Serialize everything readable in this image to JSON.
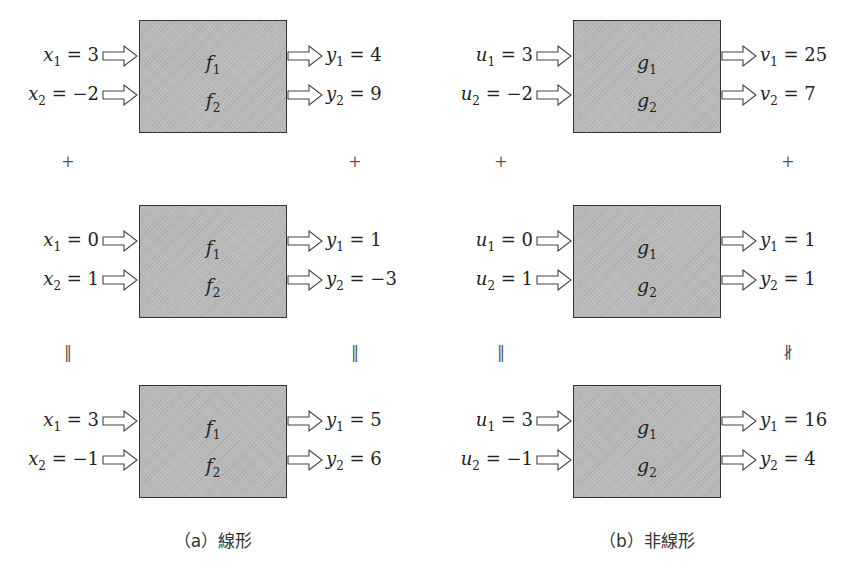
{
  "panels": [
    {
      "id": "a",
      "caption": "（a）線形",
      "func_names": [
        "f",
        "f"
      ],
      "rows": [
        {
          "inputs": [
            {
              "var": "x",
              "sub": "1",
              "val": "3"
            },
            {
              "var": "x",
              "sub": "2",
              "val": "−2"
            }
          ],
          "outputs": [
            {
              "var": "y",
              "sub": "1",
              "val": "4"
            },
            {
              "var": "y",
              "sub": "2",
              "val": "9"
            }
          ]
        },
        {
          "inputs": [
            {
              "var": "x",
              "sub": "1",
              "val": "0"
            },
            {
              "var": "x",
              "sub": "2",
              "val": "1"
            }
          ],
          "outputs": [
            {
              "var": "y",
              "sub": "1",
              "val": "1"
            },
            {
              "var": "y",
              "sub": "2",
              "val": "−3"
            }
          ]
        },
        {
          "inputs": [
            {
              "var": "x",
              "sub": "1",
              "val": "3"
            },
            {
              "var": "x",
              "sub": "2",
              "val": "−1"
            }
          ],
          "outputs": [
            {
              "var": "y",
              "sub": "1",
              "val": "5"
            },
            {
              "var": "y",
              "sub": "2",
              "val": "6"
            }
          ]
        }
      ],
      "operators": {
        "plus_left": "+",
        "plus_right": "+",
        "eq_left": "‖",
        "eq_right": "‖"
      }
    },
    {
      "id": "b",
      "caption": "（b）非線形",
      "func_names": [
        "g",
        "g"
      ],
      "rows": [
        {
          "inputs": [
            {
              "var": "u",
              "sub": "1",
              "val": "3"
            },
            {
              "var": "u",
              "sub": "2",
              "val": "−2"
            }
          ],
          "outputs": [
            {
              "var": "v",
              "sub": "1",
              "val": "25"
            },
            {
              "var": "v",
              "sub": "2",
              "val": "7"
            }
          ]
        },
        {
          "inputs": [
            {
              "var": "u",
              "sub": "1",
              "val": "0"
            },
            {
              "var": "u",
              "sub": "2",
              "val": "1"
            }
          ],
          "outputs": [
            {
              "var": "y",
              "sub": "1",
              "val": "1"
            },
            {
              "var": "y",
              "sub": "2",
              "val": "1"
            }
          ]
        },
        {
          "inputs": [
            {
              "var": "u",
              "sub": "1",
              "val": "3"
            },
            {
              "var": "u",
              "sub": "2",
              "val": "−1"
            }
          ],
          "outputs": [
            {
              "var": "y",
              "sub": "1",
              "val": "16"
            },
            {
              "var": "y",
              "sub": "2",
              "val": "4"
            }
          ]
        }
      ],
      "operators": {
        "plus_left": "+",
        "plus_right": "+",
        "eq_left": "‖",
        "eq_right": "∦"
      }
    }
  ],
  "colors": {
    "box_fill": "#b9b9b9",
    "box_border": "#333333",
    "text": "#222222"
  }
}
